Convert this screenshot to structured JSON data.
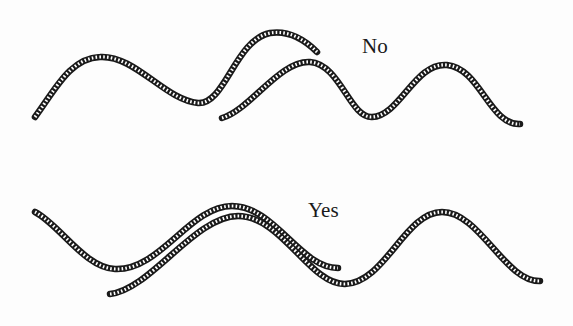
{
  "diagram": {
    "title": "",
    "panels": [
      {
        "id": "no",
        "label": "No",
        "label_pos": {
          "x": 362,
          "y": 36
        },
        "description": "Two rope strands overlapping and crossing incorrectly"
      },
      {
        "id": "yes",
        "label": "Yes",
        "label_pos": {
          "x": 308,
          "y": 200
        },
        "description": "Two rope strands laid parallel and merging correctly"
      }
    ],
    "colors": {
      "ink": "#1a1a1a",
      "background": "#fdfdfd"
    }
  }
}
